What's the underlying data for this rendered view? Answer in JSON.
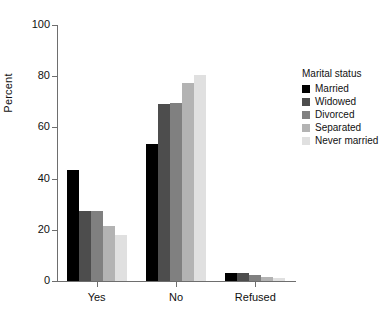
{
  "chart_data": {
    "type": "bar",
    "title": "",
    "xlabel": "",
    "ylabel": "Percent",
    "categories": [
      "Yes",
      "No",
      "Refused"
    ],
    "ylim": [
      0,
      100
    ],
    "yticks": [
      0,
      20,
      40,
      60,
      80,
      100
    ],
    "ytick_labels": [
      "0",
      "20",
      "40",
      "60",
      "80",
      "100"
    ],
    "grid": false,
    "legend_position": "right",
    "legend_title": "Marital status",
    "series": [
      {
        "name": "Married",
        "color": "#000000",
        "values": [
          43.5,
          53.5,
          3.0
        ]
      },
      {
        "name": "Widowed",
        "color": "#4d4d4d",
        "values": [
          27.5,
          69.0,
          3.0
        ]
      },
      {
        "name": "Divorced",
        "color": "#808080",
        "values": [
          27.5,
          69.5,
          2.5
        ]
      },
      {
        "name": "Separated",
        "color": "#b3b3b3",
        "values": [
          21.5,
          77.5,
          1.5
        ]
      },
      {
        "name": "Never married",
        "color": "#e0e0e0",
        "values": [
          18.0,
          80.5,
          1.0
        ]
      }
    ]
  },
  "axis": {
    "y_title": "Percent"
  }
}
